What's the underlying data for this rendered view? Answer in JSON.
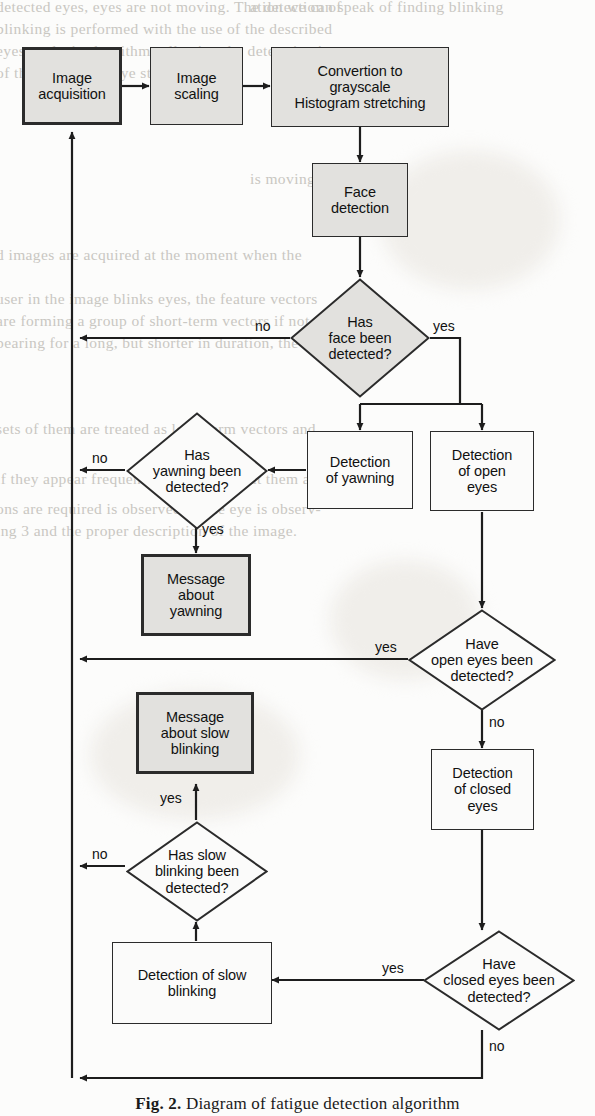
{
  "figure": {
    "caption_label": "Fig. 2.",
    "caption_text": "Diagram of fatigue detection algorithm",
    "colors": {
      "node_fill": "#e2e1de",
      "node_fill_plain": "#fbfbfa",
      "stroke": "#2b2b2b",
      "page": "#fcfcfb",
      "text": "#111111"
    }
  },
  "nodes": {
    "image_acquisition": "Image\nacquisition",
    "image_scaling": "Image\nscaling",
    "conversion": "Convertion to\ngrayscale\nHistogram stretching",
    "face_detection": "Face\ndetection",
    "q_face": "Has\nface been\ndetected?",
    "detection_yawning": "Detection\nof yawning",
    "detection_open_eyes": "Detection\nof open\neyes",
    "q_yawning": "Has\nyawning been\ndetected?",
    "msg_yawning": "Message\nabout\nyawning",
    "q_open_eyes": "Have\nopen eyes been\ndetected?",
    "msg_slow_blinking": "Message\nabout slow\nblinking",
    "detection_closed_eyes": "Detection\nof closed\neyes",
    "q_slow_blinking": "Has slow\nblinking been\ndetected?",
    "detection_slow_blinking": "Detection of slow\nblinking",
    "q_closed_eyes": "Have\nclosed eyes been\ndetected?"
  },
  "edge_labels": {
    "face_no": "no",
    "face_yes": "yes",
    "yawning_no": "no",
    "yawning_yes": "yes",
    "open_eyes_yes": "yes",
    "open_eyes_no": "no",
    "slow_blink_no": "no",
    "slow_blink_yes": "yes",
    "closed_eyes_yes": "yes",
    "closed_eyes_no": "no"
  },
  "background_text": {
    "l1": "detected eyes, eyes  are not  moving. The detection of",
    "l2": "blinking  is  performed  with  the  use of  the  described",
    "l3": "eyes analysis  algorithms  allowing  the  determination",
    "l4": "of the type of the eye state.",
    "r1": "ation  we  can  speak  of  finding  blinking",
    "r2": "is  moving.",
    "r3": "d images  are  acquired  at  the  moment  when  the",
    "r4": "user  in  the  image  blinks  eyes,   the  feature  vectors",
    "r5": "are  forming  a  group  of  short-term  vectors  if  not  ap-",
    "r6": "pearing  for  a  long,  but  shorter  in  duration,  the  vector",
    "r7": "sets  of  them  are  treated  as  long-term  vectors  and",
    "r8": "if  they  appear  frequently  we  do  not  treat  them  as  tired",
    "r9": "ons  are  required  is  observed.  If  the  eye  is  observ-",
    "r10": "ing  3  and  the  proper  description  of  the  image."
  }
}
